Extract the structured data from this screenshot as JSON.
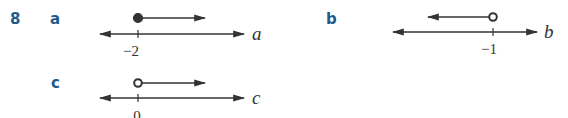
{
  "question": {
    "number": "8",
    "color": "#1f5a8c"
  },
  "parts": [
    {
      "label": "a",
      "variable": "a",
      "tick_value": "−2",
      "endpoint": "closed",
      "direction": "right"
    },
    {
      "label": "b",
      "variable": "b",
      "tick_value": "−1",
      "endpoint": "open",
      "direction": "left"
    },
    {
      "label": "c",
      "variable": "c",
      "tick_value": "0",
      "endpoint": "open",
      "direction": "right"
    }
  ],
  "line_color": "#333333"
}
